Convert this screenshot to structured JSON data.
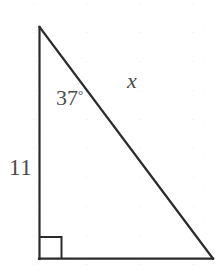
{
  "figure": {
    "type": "right-triangle-diagram",
    "background_color": "#ffffff",
    "stroke_color": "#2b2b2b",
    "text_color": "#4a4a4a",
    "labels": {
      "leg_vertical": "11",
      "angle": "37",
      "angle_degree_symbol": "°",
      "hypotenuse": "x"
    },
    "geometry": {
      "apex": [
        39,
        27
      ],
      "bottom_left": [
        39,
        259
      ],
      "bottom_right": [
        213,
        259
      ],
      "right_angle_marker_size": 22,
      "right_angle_vertex": "bottom_left"
    }
  }
}
